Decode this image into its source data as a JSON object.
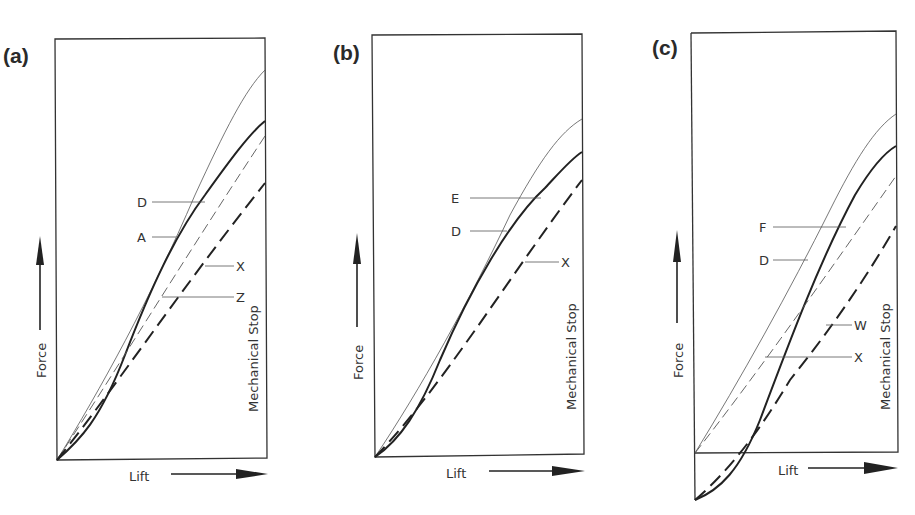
{
  "figure": {
    "panels": [
      {
        "id": "a",
        "label": "(a)",
        "y_axis_label": "Force",
        "x_axis_label": "Lift",
        "stop_label": "Mechanical Stop",
        "curve_labels": [
          "D",
          "A",
          "X",
          "Z"
        ]
      },
      {
        "id": "b",
        "label": "(b)",
        "y_axis_label": "Force",
        "x_axis_label": "Lift",
        "stop_label": "Mechanical Stop",
        "curve_labels": [
          "E",
          "D",
          "X"
        ]
      },
      {
        "id": "c",
        "label": "(c)",
        "y_axis_label": "Force",
        "x_axis_label": "Lift",
        "stop_label": "Mechanical Stop",
        "curve_labels": [
          "F",
          "D",
          "W",
          "X"
        ]
      }
    ]
  },
  "colors": {
    "line": "#222222",
    "background": "#ffffff"
  }
}
